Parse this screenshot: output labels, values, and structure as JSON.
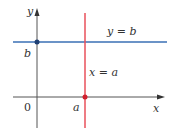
{
  "diagram": {
    "axes": {
      "x_label": "x",
      "y_label": "y",
      "origin_label": "0",
      "axis_color": "#555555"
    },
    "lines": [
      {
        "name": "horizontal-line",
        "label": "y = b",
        "color": "#3a6fb5"
      },
      {
        "name": "vertical-line",
        "label": "x = a",
        "color": "#e8505b"
      }
    ],
    "points": [
      {
        "name": "point-b",
        "label": "b",
        "color": "#1f3f73"
      },
      {
        "name": "point-a",
        "label": "a",
        "color": "#d0202e"
      }
    ]
  }
}
